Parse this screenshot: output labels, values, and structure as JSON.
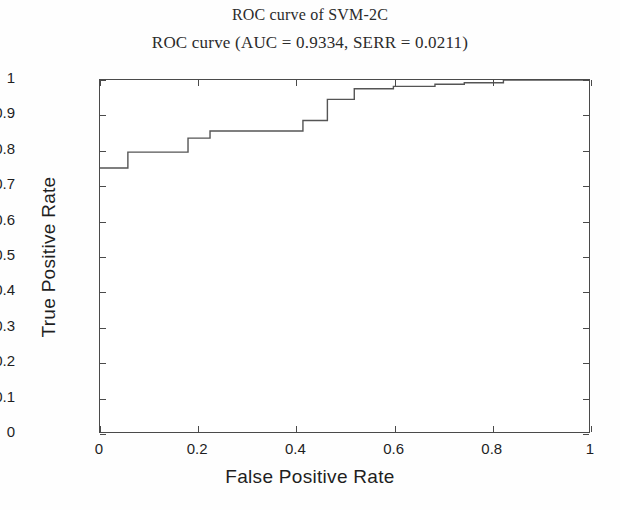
{
  "chart_data": {
    "type": "line",
    "title": "ROC curve of SVM-2C",
    "subtitle": "ROC curve (AUC = 0.9334, SERR = 0.0211)",
    "xlabel": "False Positive Rate",
    "ylabel": "True Positive Rate",
    "xlim": [
      0,
      1
    ],
    "ylim": [
      0,
      1
    ],
    "grid": false,
    "legend": "none",
    "drawstyle": "steps-post",
    "line_color": "#555555",
    "auc": 0.9334,
    "serr": 0.0211,
    "xticks": [
      "0",
      "0.2",
      "0.4",
      "0.6",
      "0.8",
      "1"
    ],
    "xtick_values": [
      0,
      0.2,
      0.4,
      0.6,
      0.8,
      1
    ],
    "yticks": [
      "0",
      "0.1",
      "0.2",
      "0.3",
      "0.4",
      "0.5",
      "0.6",
      "0.7",
      "0.8",
      "0.9",
      "1"
    ],
    "ytick_values": [
      0,
      0.1,
      0.2,
      0.3,
      0.4,
      0.5,
      0.6,
      0.7,
      0.8,
      0.9,
      1
    ],
    "series": [
      {
        "name": "ROC curve",
        "x": [
          0.0,
          0.057,
          0.057,
          0.18,
          0.18,
          0.225,
          0.225,
          0.415,
          0.415,
          0.465,
          0.465,
          0.52,
          0.52,
          0.6,
          0.6,
          0.685,
          0.685,
          0.745,
          0.745,
          0.825,
          0.825,
          1.0
        ],
        "y": [
          0.75,
          0.75,
          0.795,
          0.795,
          0.835,
          0.835,
          0.855,
          0.855,
          0.885,
          0.885,
          0.945,
          0.945,
          0.975,
          0.975,
          0.982,
          0.982,
          0.988,
          0.988,
          0.992,
          0.992,
          1.0,
          1.0
        ]
      }
    ]
  }
}
